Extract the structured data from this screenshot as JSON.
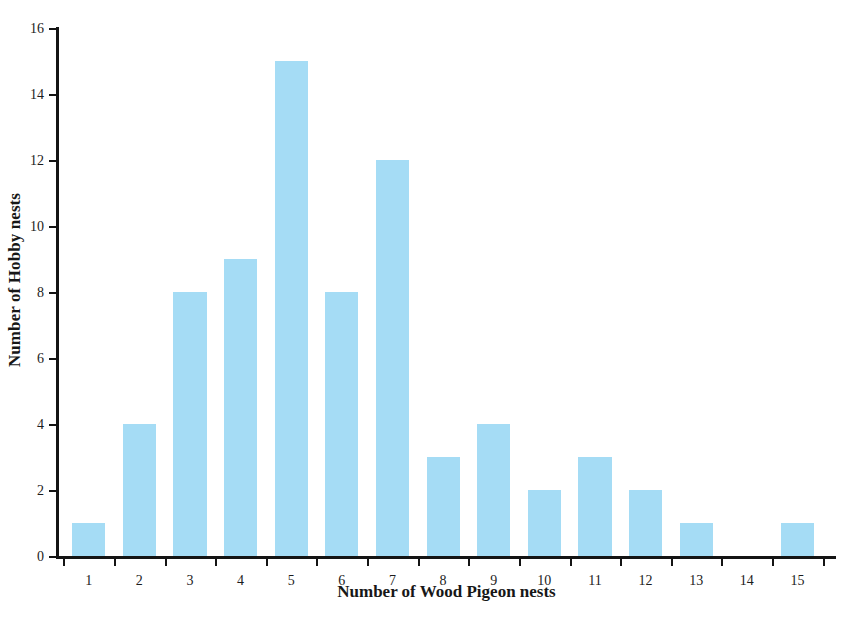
{
  "chart_data": {
    "type": "bar",
    "title": "",
    "xlabel": "Number of Wood Pigeon nests",
    "ylabel": "Number of Hobby nests",
    "categories": [
      "1",
      "2",
      "3",
      "4",
      "5",
      "6",
      "7",
      "8",
      "9",
      "10",
      "11",
      "12",
      "13",
      "14",
      "15"
    ],
    "values": [
      1,
      4,
      8,
      9,
      15,
      8,
      12,
      3,
      4,
      2,
      3,
      2,
      1,
      0,
      1
    ],
    "xlim": [
      0.5,
      15.5
    ],
    "ylim": [
      0,
      16
    ],
    "y_ticks": [
      "0",
      "2",
      "4",
      "6",
      "8",
      "10",
      "12",
      "14",
      "16"
    ],
    "y_tick_values": [
      0,
      2,
      4,
      6,
      8,
      10,
      12,
      14,
      16
    ],
    "x_ticks": [
      "1",
      "2",
      "3",
      "4",
      "5",
      "6",
      "7",
      "8",
      "9",
      "10",
      "11",
      "12",
      "13",
      "14",
      "15"
    ],
    "grid": false,
    "legend": false,
    "bar_color": "#a5dcf5",
    "axis_color": "#141414"
  },
  "caption": {
    "text": ""
  }
}
